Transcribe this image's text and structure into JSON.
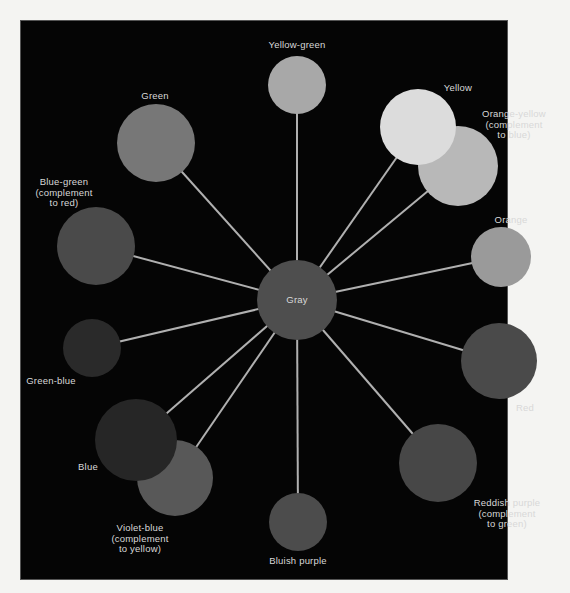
{
  "diagram": {
    "center": {
      "id": "gray",
      "label": "Gray",
      "color": "#4e4e4e"
    },
    "nodes": [
      {
        "id": "yellow-green",
        "label_lines": [
          "Yellow-green"
        ],
        "color": "#a8a8a8"
      },
      {
        "id": "yellow",
        "label_lines": [
          "Yellow"
        ],
        "color": "#dcdcdc"
      },
      {
        "id": "orange-yellow",
        "label_lines": [
          "Orange-yellow",
          "(complement",
          "to blue)"
        ],
        "color": "#b8b8b8"
      },
      {
        "id": "orange",
        "label_lines": [
          "Orange"
        ],
        "color": "#9a9a9a"
      },
      {
        "id": "red",
        "label_lines": [
          "Red"
        ],
        "color": "#4a4a4a"
      },
      {
        "id": "reddish-purple",
        "label_lines": [
          "Reddish purple",
          "(complement",
          "to green)"
        ],
        "color": "#474747"
      },
      {
        "id": "bluish-purple",
        "label_lines": [
          "Bluish purple"
        ],
        "color": "#4c4c4c"
      },
      {
        "id": "violet-blue",
        "label_lines": [
          "Violet-blue",
          "(complement",
          "to yellow)"
        ],
        "color": "#585858"
      },
      {
        "id": "blue",
        "label_lines": [
          "Blue"
        ],
        "color": "#262626"
      },
      {
        "id": "green-blue",
        "label_lines": [
          "Green-blue"
        ],
        "color": "#2a2a2a"
      },
      {
        "id": "blue-green",
        "label_lines": [
          "Blue-green",
          "(complement",
          "to red)"
        ],
        "color": "#4a4a4a"
      },
      {
        "id": "green",
        "label_lines": [
          "Green"
        ],
        "color": "#777777"
      }
    ],
    "line_color": "#b0b0b0",
    "background_color": "#050505"
  }
}
